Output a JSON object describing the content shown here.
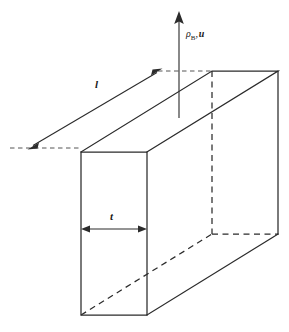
{
  "figure": {
    "kind": "3d-wireframe-slab-diagram",
    "background_color": "#ffffff",
    "line_color": "#2b2b2b",
    "hidden_line_color": "#2b2b2b",
    "extension_line_color": "#555555"
  },
  "labels": {
    "length": "l",
    "thickness": "t",
    "velocity_density": {
      "density_symbol": "ρ",
      "density_subscript": "B",
      "separator": ",",
      "velocity_symbol": "u",
      "full": "ρB, u"
    }
  },
  "annotations": {
    "length_dimension_name": "l",
    "thickness_dimension_name": "t",
    "vector_arrow_name": "rho-B-u"
  },
  "geometry": {
    "front_face": {
      "x1": 81,
      "y1": 152,
      "x2": 147,
      "y2": 315
    },
    "depth_offset": {
      "dx": 131,
      "dy": -81
    },
    "length_arrow": {
      "x1": 29,
      "y1": 148,
      "x2": 161,
      "y2": 70
    },
    "thickness_arrow": {
      "x1": 82,
      "y1": 229,
      "x2": 146,
      "y2": 229
    },
    "vector_arrow": {
      "x": 179,
      "y_top": 12,
      "y_bottom": 118
    }
  }
}
